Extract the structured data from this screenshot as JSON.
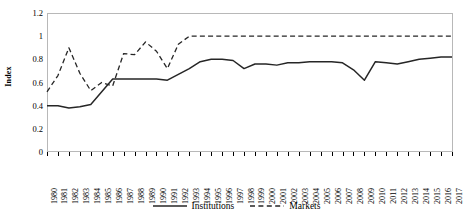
{
  "chart_data": {
    "type": "line",
    "title": "",
    "xlabel": "",
    "ylabel": "Index",
    "ylim": [
      0,
      1.2
    ],
    "ytick_step": 0.2,
    "yticks": [
      "0",
      "0.2",
      "0.4",
      "0.6",
      "0.8",
      "1",
      "1.2"
    ],
    "grid": false,
    "legend_position": "bottom-center",
    "x": [
      "1980",
      "1981",
      "1982",
      "1983",
      "1984",
      "1985",
      "1986",
      "1987",
      "1988",
      "1989",
      "1990",
      "1991",
      "1992",
      "1993",
      "1994",
      "1995",
      "1996",
      "1997",
      "1998",
      "1999",
      "2000",
      "2001",
      "2002",
      "2003",
      "2004",
      "2005",
      "2006",
      "2007",
      "2008",
      "2009",
      "2010",
      "2011",
      "2012",
      "2013",
      "2014",
      "2015",
      "2016",
      "2017"
    ],
    "series": [
      {
        "name": "Institutions",
        "style": "solid",
        "color": "#262626",
        "values": [
          0.4,
          0.4,
          0.38,
          0.39,
          0.41,
          0.52,
          0.63,
          0.63,
          0.63,
          0.63,
          0.63,
          0.62,
          0.67,
          0.72,
          0.78,
          0.8,
          0.8,
          0.79,
          0.72,
          0.76,
          0.76,
          0.75,
          0.77,
          0.77,
          0.78,
          0.78,
          0.78,
          0.77,
          0.71,
          0.62,
          0.78,
          0.77,
          0.76,
          0.78,
          0.8,
          0.81,
          0.82,
          0.82
        ]
      },
      {
        "name": "Markets",
        "style": "dashed",
        "color": "#262626",
        "values": [
          0.52,
          0.66,
          0.9,
          0.68,
          0.53,
          0.6,
          0.57,
          0.85,
          0.84,
          0.95,
          0.87,
          0.72,
          0.93,
          1.0,
          1.0,
          1.0,
          1.0,
          1.0,
          1.0,
          1.0,
          1.0,
          1.0,
          1.0,
          1.0,
          1.0,
          1.0,
          1.0,
          1.0,
          1.0,
          1.0,
          1.0,
          1.0,
          1.0,
          1.0,
          1.0,
          1.0,
          1.0,
          1.0
        ]
      }
    ]
  },
  "legend": {
    "entries": [
      {
        "label": "Institutions",
        "style": "solid"
      },
      {
        "label": "Markets",
        "style": "dashed"
      }
    ]
  }
}
